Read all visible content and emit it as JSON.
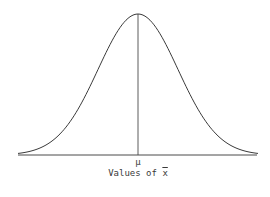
{
  "chart_data": {
    "type": "line",
    "title": "",
    "xlabel": "Values of x̄",
    "xlabel_main": "Values of ",
    "xlabel_symbol": "x",
    "ylabel": "",
    "center_label": "μ",
    "x_tick_labels": [
      "μ"
    ],
    "distribution": "normal",
    "mean": 0,
    "std_dev": 1,
    "x_range_sd": [
      -3,
      3
    ],
    "grid": false,
    "legend": null,
    "annotations": [
      "vertical line at mean from peak to x-axis"
    ],
    "colors": {
      "curve": "#3a3a3a",
      "axis": "#3a3a3a"
    }
  }
}
